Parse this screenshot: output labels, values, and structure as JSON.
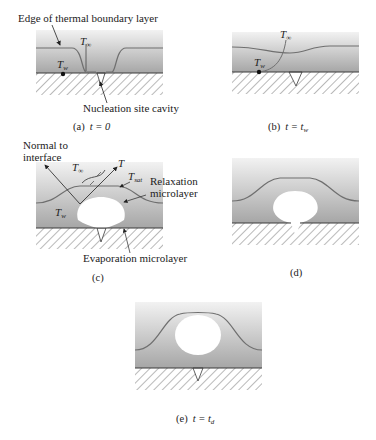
{
  "figure": {
    "colors": {
      "liquid_top": "#efefef",
      "liquid_bottom": "#a9a9a9",
      "boundary_line": "#6f6f6f",
      "surface_line": "#3a3a3a",
      "hatch": "#8a8a8a",
      "bubble": "#ffffff"
    },
    "panels": [
      {
        "id": "a",
        "caption_label": "(a)",
        "caption_eq": "t = 0",
        "annotations": {
          "edge_label": "Edge of thermal boundary layer",
          "t_inf": "T",
          "t_inf_sub": "∞",
          "t_w": "T",
          "t_w_sub": "w",
          "cavity_label": "Nucleation site cavity"
        }
      },
      {
        "id": "b",
        "caption_label": "(b)",
        "caption_eq_lhs": "t = t",
        "caption_eq_sub": "w",
        "annotations": {
          "t_inf": "T",
          "t_inf_sub": "∞",
          "t_w": "T",
          "t_w_sub": "w"
        }
      },
      {
        "id": "c",
        "caption_label": "(c)",
        "annotations": {
          "normal_label_1": "Normal to",
          "normal_label_2": "interface",
          "t_inf": "T",
          "t_inf_sub": "∞",
          "t": "T",
          "t_sat": "T",
          "t_sat_sub": "sat",
          "relax_1": "Relaxation",
          "relax_2": "microlayer",
          "t_w": "T",
          "t_w_sub": "w",
          "evap_label": "Evaporation microlayer"
        }
      },
      {
        "id": "d",
        "caption_label": "(d)"
      },
      {
        "id": "e",
        "caption_label": "(e)",
        "caption_eq_lhs": "t = t",
        "caption_eq_sub": "d"
      }
    ]
  }
}
